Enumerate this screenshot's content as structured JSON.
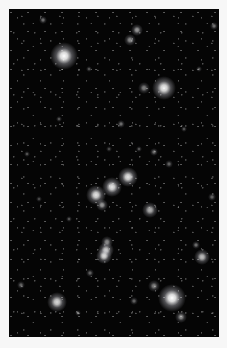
{
  "image": {
    "description": "Star field photograph on black background",
    "background_color": "#050505",
    "page_color": "#f7f7f7",
    "stars": [
      {
        "x": 55,
        "y": 47,
        "r": 7,
        "brightness": 1.0
      },
      {
        "x": 155,
        "y": 79,
        "r": 6,
        "brightness": 0.95
      },
      {
        "x": 128,
        "y": 21,
        "r": 3,
        "brightness": 0.6
      },
      {
        "x": 121,
        "y": 31,
        "r": 3,
        "brightness": 0.55
      },
      {
        "x": 119,
        "y": 168,
        "r": 5,
        "brightness": 0.9
      },
      {
        "x": 103,
        "y": 178,
        "r": 5,
        "brightness": 0.9
      },
      {
        "x": 87,
        "y": 186,
        "r": 5,
        "brightness": 0.9
      },
      {
        "x": 93,
        "y": 196,
        "r": 3,
        "brightness": 0.6
      },
      {
        "x": 141,
        "y": 201,
        "r": 4,
        "brightness": 0.7
      },
      {
        "x": 97,
        "y": 241,
        "r": 4,
        "brightness": 0.8
      },
      {
        "x": 95,
        "y": 247,
        "r": 4,
        "brightness": 0.85
      },
      {
        "x": 98,
        "y": 233,
        "r": 3,
        "brightness": 0.55
      },
      {
        "x": 193,
        "y": 248,
        "r": 4,
        "brightness": 0.75
      },
      {
        "x": 163,
        "y": 289,
        "r": 7,
        "brightness": 1.0
      },
      {
        "x": 48,
        "y": 293,
        "r": 5,
        "brightness": 0.85
      },
      {
        "x": 172,
        "y": 308,
        "r": 3,
        "brightness": 0.55
      },
      {
        "x": 145,
        "y": 277,
        "r": 3,
        "brightness": 0.5
      },
      {
        "x": 34,
        "y": 11,
        "r": 2,
        "brightness": 0.45
      },
      {
        "x": 135,
        "y": 79,
        "r": 3,
        "brightness": 0.5
      },
      {
        "x": 112,
        "y": 115,
        "r": 2,
        "brightness": 0.45
      },
      {
        "x": 145,
        "y": 143,
        "r": 2,
        "brightness": 0.45
      },
      {
        "x": 205,
        "y": 17,
        "r": 2,
        "brightness": 0.45
      },
      {
        "x": 203,
        "y": 188,
        "r": 2,
        "brightness": 0.4
      },
      {
        "x": 81,
        "y": 264,
        "r": 2,
        "brightness": 0.4
      },
      {
        "x": 12,
        "y": 276,
        "r": 2,
        "brightness": 0.4
      },
      {
        "x": 69,
        "y": 304,
        "r": 1.5,
        "brightness": 0.35
      },
      {
        "x": 125,
        "y": 292,
        "r": 2,
        "brightness": 0.4
      },
      {
        "x": 187,
        "y": 236,
        "r": 2,
        "brightness": 0.45
      },
      {
        "x": 18,
        "y": 145,
        "r": 1.5,
        "brightness": 0.35
      },
      {
        "x": 50,
        "y": 110,
        "r": 1.5,
        "brightness": 0.35
      },
      {
        "x": 80,
        "y": 60,
        "r": 1.5,
        "brightness": 0.35
      },
      {
        "x": 175,
        "y": 120,
        "r": 1.5,
        "brightness": 0.35
      },
      {
        "x": 160,
        "y": 155,
        "r": 2,
        "brightness": 0.4
      },
      {
        "x": 130,
        "y": 140,
        "r": 1.5,
        "brightness": 0.35
      },
      {
        "x": 60,
        "y": 210,
        "r": 1.5,
        "brightness": 0.35
      },
      {
        "x": 30,
        "y": 190,
        "r": 1.5,
        "brightness": 0.3
      },
      {
        "x": 190,
        "y": 60,
        "r": 1.5,
        "brightness": 0.35
      },
      {
        "x": 100,
        "y": 140,
        "r": 1.5,
        "brightness": 0.3
      }
    ]
  }
}
